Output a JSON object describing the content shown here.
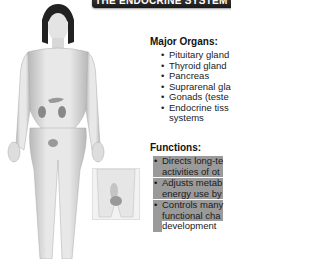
{
  "banner": {
    "title": "THE ENDOCRINE SYSTEM"
  },
  "major_organs": {
    "heading": "Major Organs:",
    "items": [
      "Pituitary gland",
      "Thyroid gland",
      "Pancreas",
      "Suprarenal gla",
      "Gonads (teste",
      "Endocrine tiss",
      "systems"
    ]
  },
  "functions": {
    "heading": "Functions:",
    "items": [
      {
        "line1": "Directs long-te",
        "line2": "activities of ot"
      },
      {
        "line1": "Adjusts metab",
        "line2": "energy use by"
      },
      {
        "line1": "Controls many",
        "line2": "functional cha",
        "line3": "development"
      }
    ]
  },
  "illustration": {
    "main": "female-figure-with-endocrine-glands",
    "inset": "male-pelvis-gonads"
  }
}
